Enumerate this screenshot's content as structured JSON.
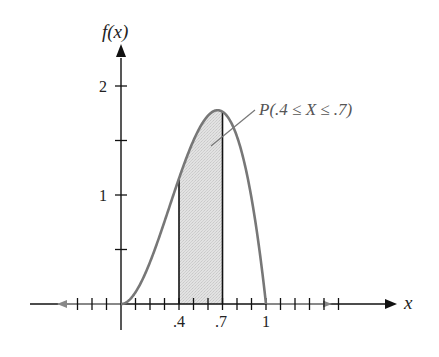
{
  "chart_data": {
    "type": "area",
    "title": "",
    "function": "f(x) = 12x^2(1-x), 0 <= x <= 1",
    "xlabel": "x",
    "ylabel": "f(x)",
    "xlim": [
      -0.55,
      1.48
    ],
    "ylim": [
      0,
      2.2
    ],
    "grid": false,
    "legend": null,
    "x_tick_labels": [
      ".4",
      ".7",
      "1"
    ],
    "x_tick_values": [
      0.4,
      0.7,
      1.0
    ],
    "x_minor_tick_step": 0.1,
    "y_tick_labels": [
      "1",
      "2"
    ],
    "y_tick_values": [
      1,
      2
    ],
    "y_minor_tick_step": 0.5,
    "curve": {
      "x": [
        0,
        0.1,
        0.2,
        0.3,
        0.4,
        0.5,
        0.6,
        0.6667,
        0.7,
        0.8,
        0.9,
        1.0
      ],
      "y": [
        0,
        0.108,
        0.384,
        0.756,
        1.152,
        1.5,
        1.728,
        1.778,
        1.764,
        1.536,
        0.972,
        0
      ]
    },
    "shaded_region": {
      "from": 0.4,
      "to": 0.7
    },
    "annotations": [
      {
        "text": "P(.4 ≤ X ≤ .7)",
        "points_to": "shaded_region"
      }
    ],
    "colors": {
      "curve": "#777777",
      "fill": "#dcdcdc",
      "axes": "#111111",
      "arrow_left": "#888888"
    }
  },
  "labels": {
    "y_axis": "f(x)",
    "x_axis": "x",
    "annotation": "P(.4 ≤ X ≤ .7)",
    "xt_04": ".4",
    "xt_07": ".7",
    "xt_1": "1",
    "yt_1": "1",
    "yt_2": "2"
  }
}
